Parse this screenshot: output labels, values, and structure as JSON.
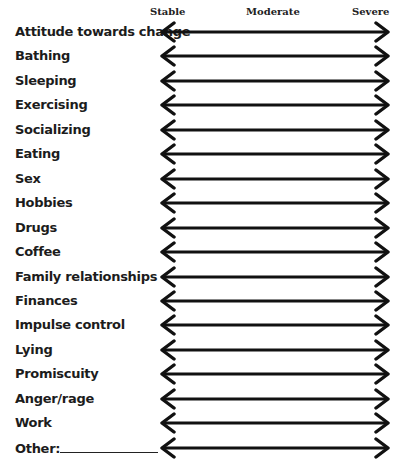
{
  "scale": {
    "left_label": "Stable",
    "middle_label": "Moderate",
    "right_label": "Severe"
  },
  "items": [
    {
      "label": "Attitude towards change"
    },
    {
      "label": "Bathing"
    },
    {
      "label": "Sleeping"
    },
    {
      "label": "Exercising"
    },
    {
      "label": "Socializing"
    },
    {
      "label": "Eating"
    },
    {
      "label": "Sex"
    },
    {
      "label": "Hobbies"
    },
    {
      "label": "Drugs"
    },
    {
      "label": "Coffee"
    },
    {
      "label": "Family relationships"
    },
    {
      "label": "Finances"
    },
    {
      "label": "Impulse control"
    },
    {
      "label": "Lying"
    },
    {
      "label": "Promiscuity"
    },
    {
      "label": "Anger/rage"
    },
    {
      "label": "Work"
    },
    {
      "label": "Other:"
    }
  ],
  "colors": {
    "arrow": "#111111",
    "text": "#1c1c1c",
    "background": "#ffffff"
  }
}
